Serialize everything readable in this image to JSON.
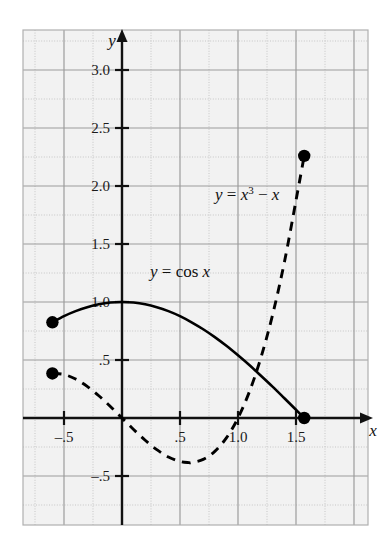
{
  "figure": {
    "background_color": "#ffffff",
    "plot_background_color": "#f2f2f2",
    "grid_major_color": "#9a9a9a",
    "grid_minor_color": "#c4c4c4",
    "axis_color": "#111111",
    "curve_color": "#000000",
    "plot_area": {
      "left": 23,
      "top": 30,
      "right": 368,
      "bottom": 525
    }
  },
  "axes": {
    "x_axis_name": "x",
    "y_axis_name": "y",
    "origin_px": {
      "x": 122,
      "y": 418
    },
    "pixels_per_unit": 116,
    "x_ticks": [
      {
        "label": "-.5",
        "value": -0.5
      },
      {
        "label": ".5",
        "value": 0.5
      },
      {
        "label": "1.0",
        "value": 1.0
      },
      {
        "label": "1.5",
        "value": 1.5
      }
    ],
    "y_ticks": [
      {
        "label": "3.0",
        "value": 3.0
      },
      {
        "label": "2.5",
        "value": 2.5
      },
      {
        "label": "2.0",
        "value": 2.0
      },
      {
        "label": "1.5",
        "value": 1.5
      },
      {
        "label": "1.0",
        "value": 1.0
      },
      {
        "label": ".5",
        "value": 0.5
      },
      {
        "label": "-.5",
        "value": -0.5
      }
    ]
  },
  "labels": {
    "cubic": {
      "text": "y = x3 - x",
      "x": 215,
      "y": 200
    },
    "cosine": {
      "text": "y = cos x",
      "x": 150,
      "y": 277
    }
  },
  "chart_data": {
    "type": "line",
    "title": "",
    "xlabel": "x",
    "ylabel": "y",
    "xlim": [
      -0.85,
      2.1
    ],
    "ylim": [
      -0.75,
      3.35
    ],
    "grid": true,
    "grid_major_step": 0.5,
    "grid_minor_step": 0.25,
    "legend": "inline-annotations",
    "series": [
      {
        "name": "y = cos x",
        "equation": "y = cos x",
        "style": "solid",
        "domain": [
          -0.6,
          1.5708
        ],
        "endpoints_filled": true,
        "x": [
          -0.6,
          -0.5,
          -0.4,
          -0.3,
          -0.2,
          -0.1,
          0.0,
          0.1,
          0.2,
          0.3,
          0.4,
          0.5,
          0.6,
          0.7,
          0.8,
          0.9,
          1.0,
          1.1,
          1.2,
          1.3,
          1.4,
          1.5,
          1.5708
        ],
        "y": [
          0.825,
          0.878,
          0.921,
          0.955,
          0.98,
          0.995,
          1.0,
          0.995,
          0.98,
          0.955,
          0.921,
          0.878,
          0.825,
          0.765,
          0.697,
          0.622,
          0.54,
          0.454,
          0.362,
          0.268,
          0.17,
          0.071,
          0.0
        ]
      },
      {
        "name": "y = x^3 - x",
        "equation": "y = x3 - x",
        "style": "dashed",
        "domain": [
          -0.6,
          1.5708
        ],
        "endpoints_filled": true,
        "x": [
          -0.6,
          -0.5,
          -0.4,
          -0.3,
          -0.2,
          -0.1,
          0.0,
          0.1,
          0.2,
          0.3,
          0.4,
          0.5,
          0.577,
          0.6,
          0.7,
          0.8,
          0.9,
          1.0,
          1.1,
          1.2,
          1.3,
          1.4,
          1.5,
          1.5708
        ],
        "y": [
          0.384,
          0.375,
          0.336,
          0.273,
          0.192,
          0.099,
          0.0,
          -0.099,
          -0.192,
          -0.273,
          -0.336,
          -0.375,
          -0.385,
          -0.384,
          -0.357,
          -0.288,
          -0.171,
          0.0,
          0.231,
          0.528,
          0.897,
          1.344,
          1.875,
          2.26
        ]
      }
    ],
    "marked_points": [
      {
        "series": "y = cos x",
        "x": -0.6,
        "y": 0.825
      },
      {
        "series": "y = cos x",
        "x": 1.5708,
        "y": 0.0
      },
      {
        "series": "y = x^3 - x",
        "x": -0.6,
        "y": 0.384
      },
      {
        "series": "y = x^3 - x",
        "x": 1.5708,
        "y": 2.26
      }
    ]
  }
}
